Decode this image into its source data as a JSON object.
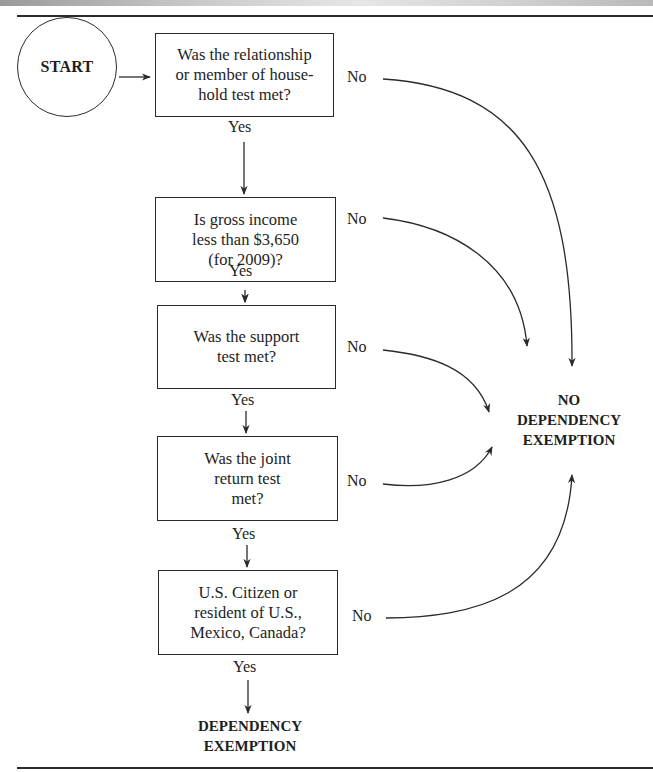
{
  "header": {
    "decorative_bar": true
  },
  "flowchart": {
    "start": {
      "label": "START"
    },
    "decisions": [
      {
        "id": "relationship",
        "text": "Was the relationship\nor member of house-\nhold test met?",
        "yes_label": "Yes",
        "no_label": "No"
      },
      {
        "id": "gross_income",
        "text": "Is gross income\nless than $3,650\n(for 2009)?",
        "yes_label": "Yes",
        "no_label": "No"
      },
      {
        "id": "support",
        "text": "Was the support\ntest met?",
        "yes_label": "Yes",
        "no_label": "No"
      },
      {
        "id": "joint_return",
        "text": "Was the joint\nreturn test\nmet?",
        "yes_label": "Yes",
        "no_label": "No"
      },
      {
        "id": "citizenship",
        "text": "U.S. Citizen or\nresident of U.S.,\nMexico, Canada?",
        "yes_label": "Yes",
        "no_label": "No"
      }
    ],
    "outcomes": {
      "no_exemption": "NO\nDEPENDENCY\nEXEMPTION",
      "exemption": "DEPENDENCY\nEXEMPTION"
    }
  },
  "colors": {
    "line": "#2a2a2a",
    "text": "#1e1e1e",
    "background": "#ffffff"
  }
}
